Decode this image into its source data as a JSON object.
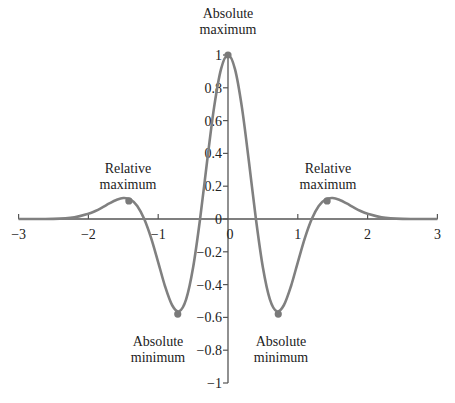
{
  "chart_data": {
    "type": "line",
    "title": "",
    "xlabel": "",
    "ylabel": "",
    "xlim": [
      -3,
      3
    ],
    "ylim": [
      -1,
      1
    ],
    "grid": false,
    "legend": null,
    "x_ticks": [
      -3,
      -2,
      -1,
      0,
      1,
      2,
      3
    ],
    "x_tick_labels": [
      "−3",
      "−2",
      "−1",
      "0",
      "1",
      "2",
      "3"
    ],
    "y_ticks": [
      1,
      0.8,
      0.6,
      0.4,
      0.2,
      0,
      -0.2,
      -0.4,
      -0.6,
      -0.8,
      -1
    ],
    "y_tick_labels": [
      "1",
      "0.8",
      "0.6",
      "0.4",
      "0.2",
      "0",
      "−0.2",
      "−0.4",
      "−0.6",
      "−0.8",
      "−1"
    ],
    "series": [
      {
        "name": "f(x)",
        "color": "#808080",
        "x": [
          -3,
          -2.5,
          -2.2,
          -2.0,
          -1.9,
          -1.8,
          -1.7,
          -1.6,
          -1.5,
          -1.4,
          -1.3,
          -1.2,
          -1.1,
          -1.0,
          -0.9,
          -0.8,
          -0.7,
          -0.6,
          -0.5,
          -0.4,
          -0.3,
          -0.2,
          -0.1,
          0,
          0.1,
          0.2,
          0.3,
          0.4,
          0.5,
          0.6,
          0.7,
          0.8,
          0.9,
          1.0,
          1.1,
          1.2,
          1.3,
          1.4,
          1.5,
          1.6,
          1.7,
          1.8,
          1.9,
          2.0,
          2.2,
          2.5,
          3
        ],
        "values": [
          0,
          0.001,
          0.01,
          0.032,
          0.049,
          0.071,
          0.095,
          0.116,
          0.128,
          0.12,
          0.08,
          0,
          -0.118,
          -0.264,
          -0.413,
          -0.526,
          -0.563,
          -0.49,
          -0.296,
          0,
          0.349,
          0.679,
          0.914,
          1,
          0.914,
          0.679,
          0.349,
          0,
          -0.296,
          -0.49,
          -0.563,
          -0.526,
          -0.413,
          -0.264,
          -0.118,
          0,
          0.08,
          0.12,
          0.128,
          0.116,
          0.095,
          0.071,
          0.049,
          0.032,
          0.01,
          0.001,
          0
        ]
      }
    ],
    "annotations": [
      {
        "id": "abs-max",
        "line1": "Absolute",
        "line2": "maximum",
        "point": [
          0,
          1
        ]
      },
      {
        "id": "rel-max-left",
        "line1": "Relative",
        "line2": "maximum",
        "point": [
          -1.42,
          0.11
        ]
      },
      {
        "id": "rel-max-right",
        "line1": "Relative",
        "line2": "maximum",
        "point": [
          1.42,
          0.11
        ]
      },
      {
        "id": "abs-min-left",
        "line1": "Absolute",
        "line2": "minimum",
        "point": [
          -0.72,
          -0.58
        ]
      },
      {
        "id": "abs-min-right",
        "line1": "Absolute",
        "line2": "minimum",
        "point": [
          0.72,
          -0.58
        ]
      }
    ]
  }
}
